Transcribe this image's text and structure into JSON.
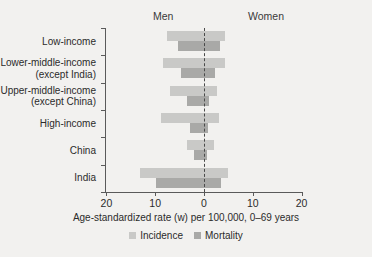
{
  "headers": {
    "left": "Men",
    "right": "Women"
  },
  "axis": {
    "title": "Age-standardized rate (w) per 100,000, 0–69 years",
    "ticks": [
      {
        "label": "20",
        "value": -20
      },
      {
        "label": "10",
        "value": -10
      },
      {
        "label": "0",
        "value": 0
      },
      {
        "label": "10",
        "value": 10
      },
      {
        "label": "20",
        "value": 20
      }
    ],
    "min": -20,
    "max": 20
  },
  "legend": [
    {
      "label": "Incidence",
      "color": "#c9c9c7"
    },
    {
      "label": "Mortality",
      "color": "#a9a9a7"
    }
  ],
  "chart_data": {
    "type": "bar",
    "orientation": "horizontal",
    "layout": "diverging-back-to-back",
    "title": "",
    "xlabel": "Age-standardized rate (w) per 100,000, 0–69 years",
    "ylabel": "",
    "xlim": [
      -20,
      20
    ],
    "grid": false,
    "legend_position": "bottom-center",
    "left_side": "Men",
    "right_side": "Women",
    "categories": [
      "Low-income",
      "Lower-middle-income (except India)",
      "Upper-middle-income (except China)",
      "High-income",
      "China",
      "India"
    ],
    "category_lines": [
      [
        "Low-income"
      ],
      [
        "Lower-middle-income",
        "(except India)"
      ],
      [
        "Upper-middle-income",
        "(except China)"
      ],
      [
        "High-income"
      ],
      [
        "China"
      ],
      [
        "India"
      ]
    ],
    "series": [
      {
        "name": "Incidence",
        "color": "#c9c9c7",
        "men": [
          7.6,
          8.5,
          6.9,
          8.9,
          3.5,
          13.2
        ],
        "women": [
          4.4,
          4.3,
          2.6,
          3.1,
          2.0,
          5.0
        ]
      },
      {
        "name": "Mortality",
        "color": "#a9a9a7",
        "men": [
          5.3,
          4.7,
          3.5,
          2.8,
          2.0,
          9.9
        ],
        "women": [
          3.2,
          2.2,
          1.0,
          0.9,
          0.7,
          3.5
        ]
      }
    ]
  }
}
